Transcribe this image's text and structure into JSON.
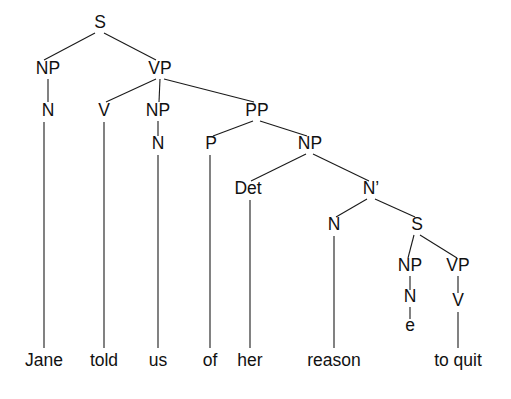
{
  "figure": {
    "kind": "syntax-tree",
    "sentence": "Jane told us of her reason to quit",
    "background_color": "#ffffff",
    "line_color": "#1a1a1a",
    "text_color": "#111111",
    "width": 511,
    "height": 399
  },
  "nodes": {
    "s_root": {
      "label": "S",
      "x": 100,
      "y": 28
    },
    "np_subj": {
      "label": "NP",
      "x": 48,
      "y": 74
    },
    "vp_main": {
      "label": "VP",
      "x": 160,
      "y": 74
    },
    "n_subj": {
      "label": "N",
      "x": 48,
      "y": 116
    },
    "v_told": {
      "label": "V",
      "x": 104,
      "y": 116
    },
    "np_obj": {
      "label": "NP",
      "x": 158,
      "y": 116
    },
    "pp": {
      "label": "PP",
      "x": 257,
      "y": 116
    },
    "n_obj": {
      "label": "N",
      "x": 158,
      "y": 149
    },
    "p_of": {
      "label": "P",
      "x": 211,
      "y": 149
    },
    "np_pobj": {
      "label": "NP",
      "x": 310,
      "y": 149
    },
    "det_her": {
      "label": "Det",
      "x": 248,
      "y": 194
    },
    "nbar": {
      "label": "N’",
      "x": 371,
      "y": 194
    },
    "n_reason": {
      "label": "N",
      "x": 334,
      "y": 230
    },
    "s_embed": {
      "label": "S",
      "x": 417,
      "y": 230
    },
    "np_empty": {
      "label": "NP",
      "x": 410,
      "y": 271
    },
    "vp_embed": {
      "label": "VP",
      "x": 458,
      "y": 271
    },
    "n_empty": {
      "label": "N",
      "x": 410,
      "y": 302
    },
    "v_quit": {
      "label": "V",
      "x": 458,
      "y": 306
    },
    "e_trace": {
      "label": "e",
      "x": 410,
      "y": 331
    }
  },
  "terminals": [
    {
      "id": "t_jane",
      "label": "Jane",
      "x": 44,
      "y": 366,
      "parent": "n_subj",
      "line_top": 122,
      "line_bottom": 348
    },
    {
      "id": "t_told",
      "label": "told",
      "x": 104,
      "y": 366,
      "parent": "v_told",
      "line_top": 122,
      "line_bottom": 348
    },
    {
      "id": "t_us",
      "label": "us",
      "x": 158,
      "y": 366,
      "parent": "n_obj",
      "line_top": 155,
      "line_bottom": 348
    },
    {
      "id": "t_of",
      "label": "of",
      "x": 210,
      "y": 366,
      "parent": "p_of",
      "line_top": 155,
      "line_bottom": 348
    },
    {
      "id": "t_her",
      "label": "her",
      "x": 250,
      "y": 366,
      "parent": "det_her",
      "line_top": 200,
      "line_bottom": 348
    },
    {
      "id": "t_reason",
      "label": "reason",
      "x": 334,
      "y": 366,
      "parent": "n_reason",
      "line_top": 236,
      "line_bottom": 348
    },
    {
      "id": "t_toquit",
      "label": "to quit",
      "x": 458,
      "y": 366,
      "parent": "v_quit",
      "line_top": 312,
      "line_bottom": 348
    }
  ],
  "edges": [
    {
      "from": "s_root",
      "to": "np_subj",
      "x1": 95,
      "y1": 33,
      "x2": 44,
      "y2": 60
    },
    {
      "from": "s_root",
      "to": "vp_main",
      "x1": 104,
      "y1": 33,
      "x2": 156,
      "y2": 60
    },
    {
      "from": "np_subj",
      "to": "n_subj",
      "x1": 48,
      "y1": 79,
      "x2": 48,
      "y2": 102
    },
    {
      "from": "vp_main",
      "to": "v_told",
      "x1": 156,
      "y1": 79,
      "x2": 106,
      "y2": 102
    },
    {
      "from": "vp_main",
      "to": "np_obj",
      "x1": 160,
      "y1": 79,
      "x2": 159,
      "y2": 102
    },
    {
      "from": "vp_main",
      "to": "pp",
      "x1": 164,
      "y1": 79,
      "x2": 254,
      "y2": 102
    },
    {
      "from": "np_obj",
      "to": "n_obj",
      "x1": 158,
      "y1": 121,
      "x2": 158,
      "y2": 136
    },
    {
      "from": "pp",
      "to": "p_of",
      "x1": 253,
      "y1": 121,
      "x2": 213,
      "y2": 136
    },
    {
      "from": "pp",
      "to": "np_pobj",
      "x1": 260,
      "y1": 121,
      "x2": 307,
      "y2": 136
    },
    {
      "from": "np_pobj",
      "to": "det_her",
      "x1": 306,
      "y1": 154,
      "x2": 251,
      "y2": 181
    },
    {
      "from": "np_pobj",
      "to": "nbar",
      "x1": 313,
      "y1": 154,
      "x2": 369,
      "y2": 181
    },
    {
      "from": "nbar",
      "to": "n_reason",
      "x1": 367,
      "y1": 199,
      "x2": 336,
      "y2": 217
    },
    {
      "from": "nbar",
      "to": "s_embed",
      "x1": 375,
      "y1": 199,
      "x2": 415,
      "y2": 217
    },
    {
      "from": "s_embed",
      "to": "np_empty",
      "x1": 414,
      "y1": 235,
      "x2": 408,
      "y2": 258
    },
    {
      "from": "s_embed",
      "to": "vp_embed",
      "x1": 420,
      "y1": 235,
      "x2": 457,
      "y2": 258
    },
    {
      "from": "np_empty",
      "to": "n_empty",
      "x1": 410,
      "y1": 276,
      "x2": 410,
      "y2": 290
    },
    {
      "from": "n_empty",
      "to": "e_trace",
      "x1": 410,
      "y1": 307,
      "x2": 410,
      "y2": 319
    },
    {
      "from": "vp_embed",
      "to": "v_quit",
      "x1": 458,
      "y1": 276,
      "x2": 458,
      "y2": 293
    }
  ]
}
